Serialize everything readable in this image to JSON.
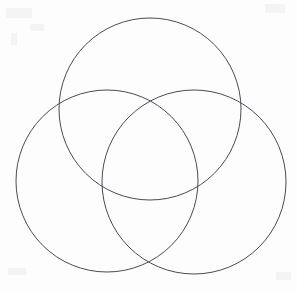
{
  "figure": {
    "kind": "venn-diagram",
    "width": 297,
    "height": 290,
    "background_color": "#fdfdfd",
    "stroke_color": "#4a4a52",
    "stroke_width": 1,
    "fill": "none",
    "label_text": "",
    "has_labels": false,
    "has_shading": false
  },
  "chart_data": {
    "type": "venn",
    "title": "",
    "subtitle": "",
    "xlabel": "",
    "ylabel": "",
    "grid": false,
    "legend": "none",
    "set_count": 3,
    "region_count": 7,
    "sets": [
      {
        "id": "top",
        "name": "top-circle",
        "label": "",
        "cx": 150,
        "cy": 109,
        "r": 91,
        "stroke": "#4a4a52",
        "fill": "none"
      },
      {
        "id": "left",
        "name": "left-circle",
        "label": "",
        "cx": 107,
        "cy": 181,
        "r": 91,
        "stroke": "#4a4a52",
        "fill": "none"
      },
      {
        "id": "right",
        "name": "right-circle",
        "label": "",
        "cx": 194,
        "cy": 182,
        "r": 92,
        "stroke": "#4a4a52",
        "fill": "none"
      }
    ],
    "regions": [
      {
        "id": "top-only",
        "sets": [
          "top"
        ],
        "value": ""
      },
      {
        "id": "left-only",
        "sets": [
          "left"
        ],
        "value": ""
      },
      {
        "id": "right-only",
        "sets": [
          "right"
        ],
        "value": ""
      },
      {
        "id": "top-left",
        "sets": [
          "top",
          "left"
        ],
        "value": ""
      },
      {
        "id": "top-right",
        "sets": [
          "top",
          "right"
        ],
        "value": ""
      },
      {
        "id": "left-right",
        "sets": [
          "left",
          "right"
        ],
        "value": ""
      },
      {
        "id": "top-left-right",
        "sets": [
          "top",
          "left",
          "right"
        ],
        "value": ""
      }
    ],
    "xlim": [
      0,
      297
    ],
    "ylim": [
      0,
      290
    ]
  }
}
